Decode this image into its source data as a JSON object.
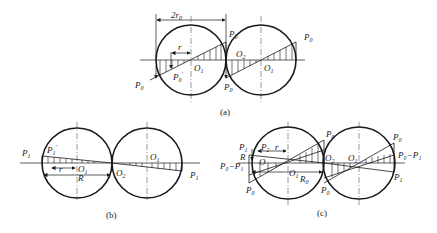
{
  "figure": {
    "panels": [
      {
        "id": "a",
        "caption": "(a)",
        "labels": {
          "dimension": "2r",
          "dimension_sub": "0",
          "r": "r",
          "P0_top": "P",
          "P0_top_sub": "0",
          "P0_right": "P",
          "P0_right_sub": "0",
          "P0_left": "P",
          "P0_left_sub": "0",
          "P0_prime": "P",
          "P0_prime_sub": "0",
          "P0_prime_mark": "′",
          "P0_bottom": "P",
          "P0_bottom_sub": "0",
          "O1_left": "O",
          "O1_left_sub": "1",
          "O2": "O",
          "O2_sub": "2",
          "O1_right": "O",
          "O1_right_sub": "1"
        }
      },
      {
        "id": "b",
        "caption": "(b)",
        "labels": {
          "P1_left": "P",
          "P1_left_sub": "1",
          "P1_prime": "P",
          "P1_prime_sub": "1",
          "P1_prime_mark": "′",
          "r": "r",
          "R": "R",
          "O1_left": "O",
          "O1_left_sub": "1",
          "O2": "O",
          "O2_sub": "2",
          "O1_right": "O",
          "O1_right_sub": "1",
          "P1_right": "P",
          "P1_right_sub": "1"
        }
      },
      {
        "id": "c",
        "caption": "(c)",
        "labels": {
          "P1": "P",
          "P1_sub": "1",
          "P2": "P",
          "P2_sub": "2",
          "r": "r",
          "R": "R",
          "O": "O",
          "P0_minus_P1_left": "P₀−P₁",
          "O1": "O",
          "O1_sub": "1",
          "R0": "R",
          "R0_sub": "0",
          "P0_bottom_left": "P",
          "P0_bottom_left_sub": "0",
          "P0_top": "P",
          "P0_top_sub": "0",
          "O2": "O",
          "O2_sub": "2",
          "O1_right": "O",
          "O1_right_sub": "1",
          "P0_bottom_mid": "P",
          "P0_bottom_mid_sub": "0",
          "P0_top_right": "P",
          "P0_top_right_sub": "0",
          "P0_minus_P1_right": "P₀−P₁",
          "P1_right": "P",
          "P1_right_sub": "1"
        }
      }
    ]
  }
}
